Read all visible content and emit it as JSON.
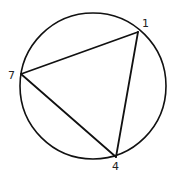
{
  "diagram": {
    "type": "inscribed-triangle",
    "circle": {
      "cx": 93,
      "cy": 86,
      "r": 73,
      "stroke": "#111111",
      "stroke_width": 1.6
    },
    "points": [
      {
        "id": "p1",
        "label": "1",
        "x": 138,
        "y": 32,
        "label_x": 142,
        "label_y": 27
      },
      {
        "id": "p7",
        "label": "7",
        "x": 21,
        "y": 74,
        "label_x": 8,
        "label_y": 79
      },
      {
        "id": "p4",
        "label": "4",
        "x": 116,
        "y": 157,
        "label_x": 112,
        "label_y": 170
      }
    ],
    "edges": [
      [
        "p1",
        "p7"
      ],
      [
        "p7",
        "p4"
      ],
      [
        "p4",
        "p1"
      ]
    ],
    "line_color": "#111111"
  }
}
